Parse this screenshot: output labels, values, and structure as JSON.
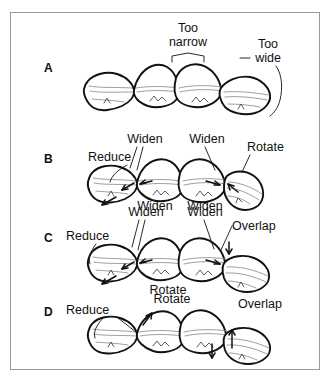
{
  "figure": {
    "border_color": "#9a9a9a",
    "background_color": "#ffffff",
    "outline_color": "#111111",
    "detail_color": "#8d8d8d",
    "panel_count": 4
  },
  "panels": [
    {
      "id": "A",
      "letter": "A",
      "annotations": [
        {
          "key": "too_narrow",
          "text": "Too",
          "line2": "narrow"
        },
        {
          "key": "too_wide",
          "text": "Too",
          "line2": "wide"
        }
      ],
      "labels": {
        "too_line1": "Too",
        "too_narrow_line2": "narrow",
        "too2_line1": "Too",
        "too_wide_line2": "wide"
      }
    },
    {
      "id": "B",
      "letter": "B",
      "labels": {
        "reduce": "Reduce",
        "widen_top_left": "Widen",
        "widen_top_right": "Widen",
        "rotate": "Rotate",
        "widen_bottom_left": "Widen",
        "widen_bottom_right": "Widen"
      }
    },
    {
      "id": "C",
      "letter": "C",
      "labels": {
        "reduce": "Reduce",
        "widen_top_left": "Widen",
        "widen_top_right": "Widen",
        "overlap": "Overlap",
        "rotate_bottom": "Rotate"
      }
    },
    {
      "id": "D",
      "letter": "D",
      "labels": {
        "reduce": "Reduce",
        "rotate": "Rotate",
        "overlap": "Overlap"
      }
    }
  ]
}
